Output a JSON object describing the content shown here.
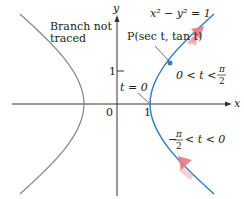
{
  "diagram": {
    "equation_label": "x² − y² = 1",
    "point_label": "P(sec t, tan t)",
    "left_branch_label_line1": "Branch not",
    "left_branch_label_line2": "traced",
    "t_zero_label": "t = 0",
    "upper_interval_label": "0 < t <",
    "upper_interval_frac_num": "π",
    "upper_interval_frac_den": "2",
    "lower_interval_prefix": "−",
    "lower_interval_frac_num": "π",
    "lower_interval_frac_den": "2",
    "lower_interval_suffix": "< t < 0",
    "axes": {
      "x_label": "x",
      "y_label": "y",
      "origin_label": "0",
      "x_tick_label": "1",
      "y_tick_label": "1"
    },
    "colors": {
      "traced_branch": "#3a7cc3",
      "untraced_branch": "#8a8a8a",
      "direction_arrow": "#e57a86",
      "axis": "#333333"
    }
  }
}
